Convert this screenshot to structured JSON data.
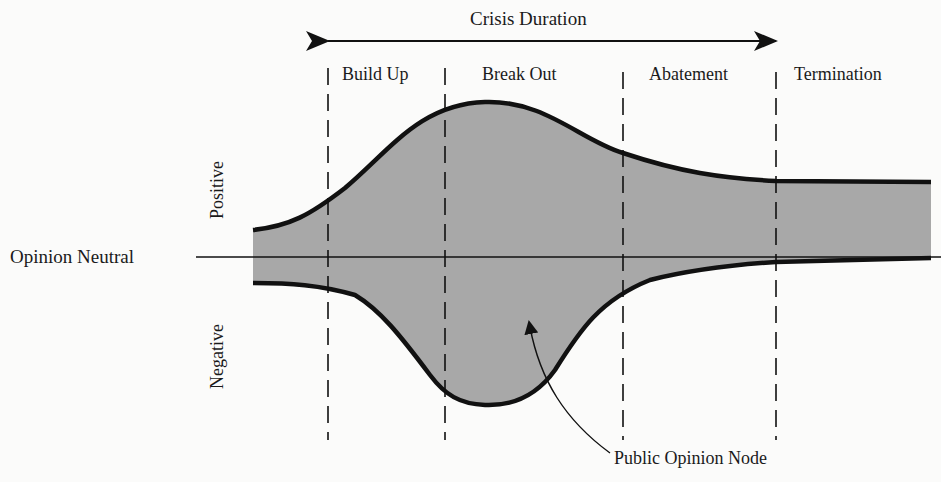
{
  "diagram": {
    "title": "Crisis Duration",
    "phases": [
      {
        "label": "Build Up"
      },
      {
        "label": "Break Out"
      },
      {
        "label": "Abatement"
      },
      {
        "label": "Termination"
      }
    ],
    "axis": {
      "neutral_label": "Opinion Neutral",
      "positive_label": "Positive",
      "negative_label": "Negative"
    },
    "annotation": "Public Opinion Node",
    "colors": {
      "fill": "#a9a9a9",
      "stroke": "#111111",
      "background": "#fbfbfa"
    }
  }
}
